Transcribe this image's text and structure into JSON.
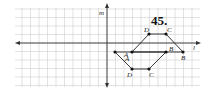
{
  "problem_number": "45.",
  "axes": {
    "horizontal_label": "l",
    "vertical_label": "m"
  },
  "grid": {
    "x0": 15,
    "x1": 200,
    "y0": 8,
    "y1": 87,
    "step": 8.5,
    "color": "#c8c8c8"
  },
  "figure_original": {
    "vertices": [
      {
        "name": "A",
        "x": 132,
        "y": 52
      },
      {
        "name": "D",
        "x": 149,
        "y": 34
      },
      {
        "name": "C",
        "x": 166,
        "y": 34
      },
      {
        "name": "B",
        "x": 183,
        "y": 52
      }
    ]
  },
  "figure_image": {
    "vertices": [
      {
        "name": "A",
        "x": 115,
        "y": 52
      },
      {
        "name": "D",
        "x": 132,
        "y": 69
      },
      {
        "name": "C",
        "x": 149,
        "y": 69
      },
      {
        "name": "B",
        "x": 166,
        "y": 52
      }
    ]
  },
  "labels": {
    "A_orig": "A",
    "B_orig": "B",
    "C_orig": "C",
    "D_orig": "D",
    "A_img": "A",
    "B_img": "B",
    "C_img": "C",
    "D_img": "D"
  }
}
